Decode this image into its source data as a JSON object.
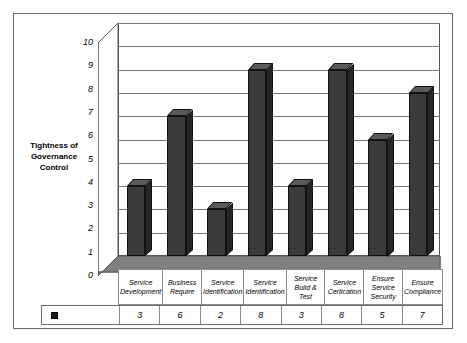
{
  "chart_data": {
    "type": "bar",
    "title": "",
    "ylabel": "Tightness of Governance Control",
    "xlabel": "",
    "ylim": [
      0,
      10
    ],
    "ytick_step": 1,
    "grid": true,
    "legend_position": "bottom-left-table",
    "legend_entries": [
      {
        "marker": "black-square",
        "label": ""
      }
    ],
    "style": "3d-column",
    "categories": [
      "Service Development",
      "Business Require",
      "Service Identification",
      "Service Identification",
      "Service Build & Test",
      "Service Certication",
      "Ensure Service Security",
      "Ensure Compliance"
    ],
    "values": [
      3,
      6,
      2,
      8,
      3,
      8,
      5,
      7
    ],
    "yticks": [
      "10",
      "9",
      "8",
      "7",
      "6",
      "5",
      "4",
      "3",
      "2",
      "1",
      "0"
    ],
    "value_labels": [
      "3",
      "6",
      "2",
      "8",
      "3",
      "8",
      "5",
      "7"
    ],
    "colors": {
      "bar_front": "#3b3b3b",
      "bar_top": "#5a5a5a",
      "bar_side": "#262626",
      "floor": "#808080",
      "gridline": "#777777",
      "frame_border": "#6b6b6b",
      "text": "#000000"
    }
  },
  "axis": {
    "title_lines": [
      "Tightness of",
      "Governance",
      "Control"
    ],
    "title_text": "Tightness of Governance Control"
  },
  "category_labels": [
    {
      "lines": [
        "Service",
        "Development"
      ]
    },
    {
      "lines": [
        "Business",
        "Require"
      ]
    },
    {
      "lines": [
        "Service",
        "Identification"
      ]
    },
    {
      "lines": [
        "Service",
        "Identification"
      ]
    },
    {
      "lines": [
        "Service",
        "Build & Test"
      ]
    },
    {
      "lines": [
        "Service",
        "Certication"
      ]
    },
    {
      "lines": [
        "Ensure",
        "Service",
        "Security"
      ]
    },
    {
      "lines": [
        "Ensure",
        "Compliance"
      ]
    }
  ]
}
